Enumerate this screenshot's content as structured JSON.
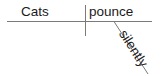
{
  "diagram": {
    "type": "sentence-diagram",
    "sentence": "Cats pounce silently",
    "subject": "Cats",
    "verb": "pounce",
    "modifier": "silently",
    "colors": {
      "line": "#7a7a7a",
      "text": "#1a1a1a",
      "background": "#ffffff"
    }
  }
}
